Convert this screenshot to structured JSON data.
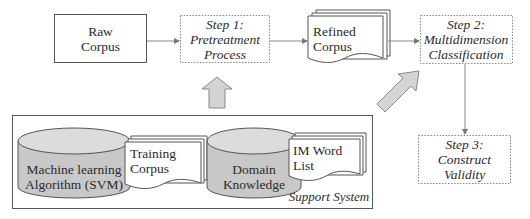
{
  "nodes": {
    "raw_corpus": {
      "line1": "Raw",
      "line2": "Corpus"
    },
    "step1": {
      "line1": "Step 1:",
      "line2": "Pretreatment",
      "line3": "Process"
    },
    "refined_corpus": {
      "line1": "Refined",
      "line2": "Corpus"
    },
    "step2": {
      "line1": "Step 2:",
      "line2": "Multidimension",
      "line3": "Classification"
    },
    "step3": {
      "line1": "Step 3:",
      "line2": "Construct",
      "line3": "Validity"
    }
  },
  "support_system": {
    "label": "Support System",
    "items": [
      {
        "type": "database",
        "line1": "Machine learning",
        "line2": "Algorithm (SVM)"
      },
      {
        "type": "document",
        "line1": "Training",
        "line2": "Corpus"
      },
      {
        "type": "database",
        "line1": "Domain",
        "line2": "Knowledge"
      },
      {
        "type": "document",
        "line1": "IM Word",
        "line2": "List"
      }
    ]
  },
  "colors": {
    "stroke": "#555555",
    "cylinder_fill": "#c8c8c8",
    "arrow_fill": "#d2d2d2",
    "dotted": "#777777"
  }
}
